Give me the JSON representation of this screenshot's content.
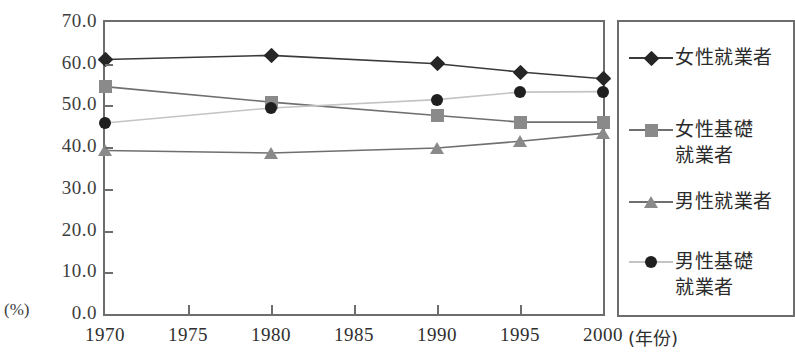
{
  "chart_data": {
    "type": "line",
    "title": "",
    "xlabel": "(年份)",
    "ylabel": "(%)",
    "x": [
      1970,
      1975,
      1980,
      1985,
      1990,
      1995,
      2000
    ],
    "x_tick_labels": [
      "1970",
      "1975",
      "1980",
      "1985",
      "1990",
      "1995",
      "2000"
    ],
    "y_tick_labels": [
      "0.0",
      "10.0",
      "20.0",
      "30.0",
      "40.0",
      "50.0",
      "60.0",
      "70.0"
    ],
    "y_ticks": [
      0,
      10,
      20,
      30,
      40,
      50,
      60,
      70
    ],
    "ylim": [
      0,
      70
    ],
    "xlim": [
      1970,
      2000
    ],
    "grid": false,
    "legend_position": "right",
    "series": [
      {
        "name": "女性就業者",
        "marker": "diamond",
        "color": "#262626",
        "line_color": "#3a3a3a",
        "x": [
          1970,
          1980,
          1990,
          1995,
          2000
        ],
        "values": [
          61.0,
          62.0,
          60.0,
          58.0,
          56.4
        ]
      },
      {
        "name": "女性基礎就業者",
        "marker": "square",
        "color": "#8a8a8a",
        "line_color": "#6f6f6f",
        "x": [
          1970,
          1980,
          1990,
          1995,
          2000
        ],
        "values": [
          54.5,
          50.8,
          47.6,
          46.0,
          46.0
        ]
      },
      {
        "name": "男性就業者",
        "marker": "triangle",
        "color": "#8a8a8a",
        "line_color": "#6f6f6f",
        "x": [
          1970,
          1980,
          1990,
          1995,
          2000
        ],
        "values": [
          39.2,
          38.6,
          39.8,
          41.4,
          43.3
        ]
      },
      {
        "name": "男性基礎就業者",
        "marker": "circle",
        "color": "#1f1f1f",
        "line_color": "#c4c4c4",
        "x": [
          1970,
          1980,
          1990,
          1995,
          2000
        ],
        "values": [
          45.8,
          49.4,
          51.4,
          53.2,
          53.3
        ]
      }
    ]
  },
  "legend": {
    "entries": [
      {
        "label": "女性就業者",
        "marker": "diamond",
        "color": "#262626",
        "line_color": "#3a3a3a"
      },
      {
        "label": "女性基礎\n就業者",
        "marker": "square",
        "color": "#8a8a8a",
        "line_color": "#6f6f6f"
      },
      {
        "label": "男性就業者",
        "marker": "triangle",
        "color": "#8a8a8a",
        "line_color": "#6f6f6f"
      },
      {
        "label": "男性基礎\n就業者",
        "marker": "circle",
        "color": "#1f1f1f",
        "line_color": "#c4c4c4"
      }
    ]
  },
  "axes": {
    "y_axis_unit": "(%)",
    "x_axis_unit": "(年份)"
  }
}
